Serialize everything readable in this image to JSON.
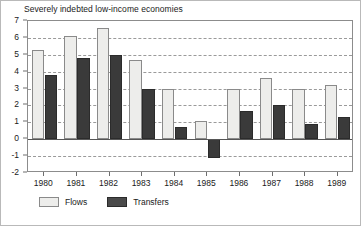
{
  "chart_data": {
    "type": "bar",
    "title": "Severely indebted low-income economies",
    "xlabel": "",
    "ylabel": "",
    "ylim": [
      -2,
      7
    ],
    "ytick_step": 1,
    "yticks": [
      "7",
      "6",
      "5",
      "4",
      "3",
      "2",
      "1",
      "0",
      "-1",
      "-2"
    ],
    "grid": true,
    "grid_style": "dashed-horizontal",
    "legend_position": "below-left",
    "categories": [
      "1980",
      "1981",
      "1982",
      "1983",
      "1984",
      "1985",
      "1986",
      "1987",
      "1988",
      "1989"
    ],
    "series": [
      {
        "name": "Flows",
        "color": "#ededeb",
        "values": [
          5.3,
          6.1,
          6.6,
          4.7,
          3.0,
          1.1,
          3.0,
          3.6,
          3.0,
          3.2
        ]
      },
      {
        "name": "Transfers",
        "color": "#3a3a3a",
        "values": [
          3.8,
          4.8,
          5.0,
          3.0,
          0.7,
          -1.1,
          1.7,
          2.0,
          0.9,
          1.3
        ]
      }
    ]
  },
  "legend": {
    "entries": [
      {
        "label": "Flows"
      },
      {
        "label": "Transfers"
      }
    ]
  }
}
